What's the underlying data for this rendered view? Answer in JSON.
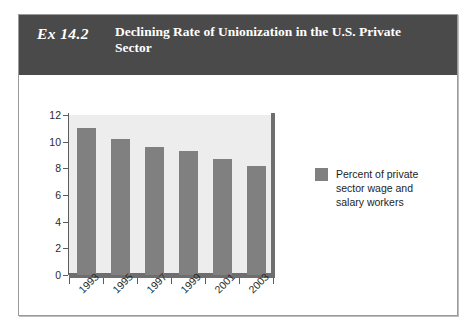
{
  "exhibit": {
    "number": "Ex 14.2",
    "title": "Declining Rate of Unionization in the U.S. Private Sector"
  },
  "chart_data": {
    "type": "bar",
    "title": "Declining Rate of Unionization in the U.S. Private Sector",
    "categories": [
      "1993",
      "1995",
      "1997",
      "1999",
      "2001",
      "2003"
    ],
    "values": [
      11.0,
      10.2,
      9.6,
      9.3,
      8.7,
      8.2
    ],
    "series": [
      {
        "name": "Percent of private sector wage and salary workers",
        "values": [
          11.0,
          10.2,
          9.6,
          9.3,
          8.7,
          8.2
        ]
      }
    ],
    "xlabel": "",
    "ylabel": "",
    "ylim": [
      0,
      12
    ],
    "yticks": [
      0,
      2,
      4,
      6,
      8,
      10,
      12
    ],
    "ytick_labels": [
      "0",
      "2",
      "4",
      "6",
      "8",
      "10",
      "12"
    ],
    "grid": false,
    "legend_position": "right",
    "legend": [
      "Percent of private sector wage and salary workers"
    ],
    "colors": {
      "bar": "#808080",
      "plot_background": "#ededed",
      "header_band": "#4a4a4a",
      "axis": "#5c5c5c",
      "baseline": "#6e6e6e"
    }
  },
  "legend": {
    "label": "Percent of private sector wage and salary workers"
  }
}
